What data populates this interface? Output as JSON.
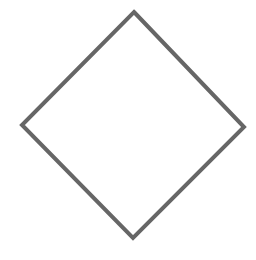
{
  "diagram": {
    "shape": "diamond",
    "stroke_color": "#666666",
    "fill_color": "#ffffff",
    "stroke_width": 4,
    "vertices": {
      "top": [
        134,
        12
      ],
      "right": [
        244,
        127
      ],
      "bottom": [
        133,
        238
      ],
      "left": [
        22,
        125
      ]
    }
  }
}
